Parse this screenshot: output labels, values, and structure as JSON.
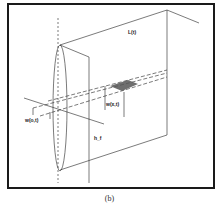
{
  "figure": {
    "caption": "(b)",
    "labels": {
      "length": "L(t)",
      "width_at_origin": "w(o,t)",
      "width_at_x": "w(x,t)",
      "height": "h_f"
    }
  }
}
